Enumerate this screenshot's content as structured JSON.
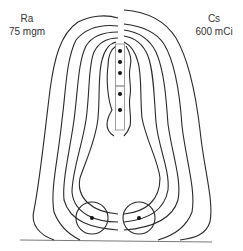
{
  "diagram": {
    "type": "isodose-comparison",
    "left_source": {
      "isotope": "Ra",
      "activity": "75 mgm"
    },
    "right_source": {
      "isotope": "Cs",
      "activity": "600 mCi"
    },
    "tandem_source_count": 5,
    "ovoid_source_count": 2,
    "isodose_curve_count_per_side": 6,
    "line_color": "#2a2a2a"
  }
}
